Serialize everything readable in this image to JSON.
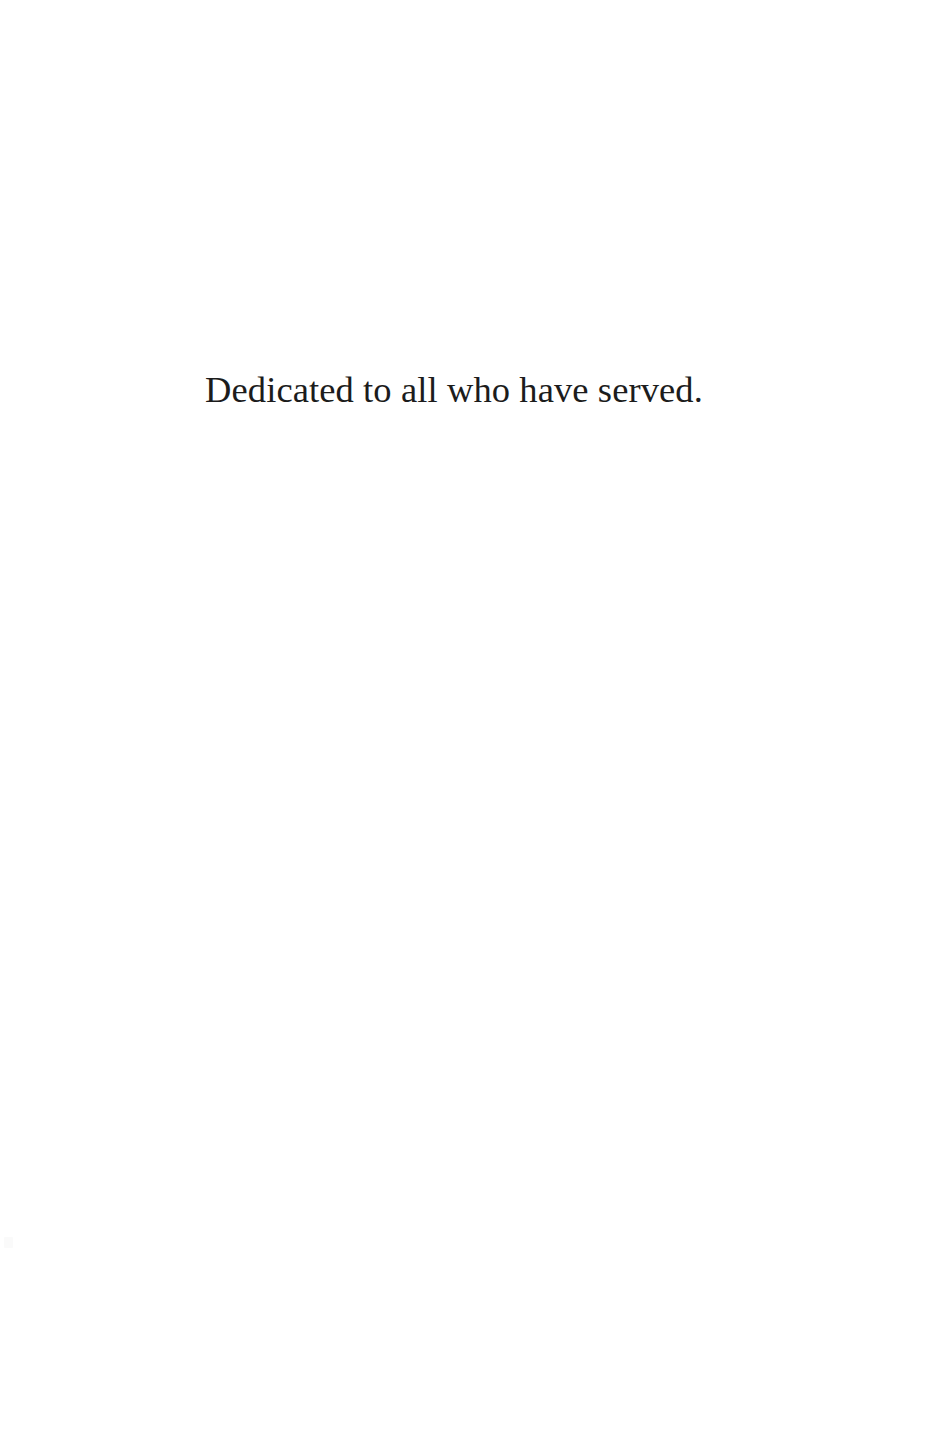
{
  "page": {
    "kind": "book-dedication-page",
    "width": 936,
    "height": 1432,
    "background_color": "#ffffff"
  },
  "dedication": {
    "text": "Dedicated to all who have served.",
    "text_color": "#1c1c1c",
    "alignment": "center"
  },
  "artifacts": {
    "scan_speck_color": "#fafafa"
  }
}
